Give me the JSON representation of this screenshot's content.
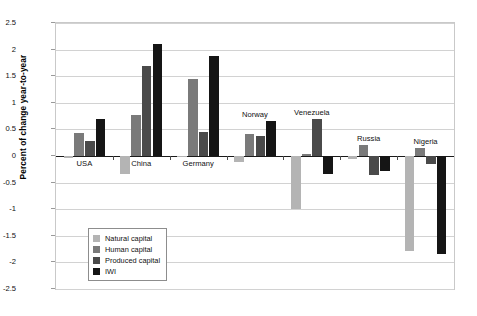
{
  "chart_data": {
    "type": "bar",
    "title": "",
    "xlabel": "",
    "ylabel": "Percent of change year-to-year",
    "ylim": [
      -2.5,
      2.5
    ],
    "ytick_labels": [
      "2.5",
      "2",
      "1.5",
      "1",
      "0.5",
      "0",
      "-0.5",
      "-1",
      "-1.5",
      "-2",
      "-2.5"
    ],
    "ytick_values": [
      2.5,
      2,
      1.5,
      1,
      0.5,
      0,
      -0.5,
      -1,
      -1.5,
      -2,
      -2.5
    ],
    "grid": true,
    "legend_position": "inside-lower-left",
    "categories": [
      "USA",
      "China",
      "Germany",
      "Norway",
      "Venezuela",
      "Russia",
      "Nigeria"
    ],
    "series": [
      {
        "name": "Natural capital",
        "color": "#b4b4b4",
        "values": [
          -0.03,
          -0.33,
          -0.02,
          -0.12,
          -1.0,
          -0.05,
          -1.78
        ]
      },
      {
        "name": "Human capital",
        "color": "#7a7a7a",
        "values": [
          0.43,
          0.77,
          1.45,
          0.42,
          0.03,
          0.21,
          0.15
        ]
      },
      {
        "name": "Produced capital",
        "color": "#4a4a4a",
        "values": [
          0.29,
          1.7,
          0.46,
          0.37,
          0.7,
          -0.36,
          -0.15
        ]
      },
      {
        "name": "IWI",
        "color": "#151515",
        "values": [
          0.7,
          2.1,
          1.88,
          0.65,
          -0.33,
          -0.28,
          -1.85
        ]
      }
    ]
  },
  "legend": {
    "items": [
      {
        "label": "Natural capital"
      },
      {
        "label": "Human capital"
      },
      {
        "label": "Produced capital"
      },
      {
        "label": "IWI"
      }
    ]
  }
}
